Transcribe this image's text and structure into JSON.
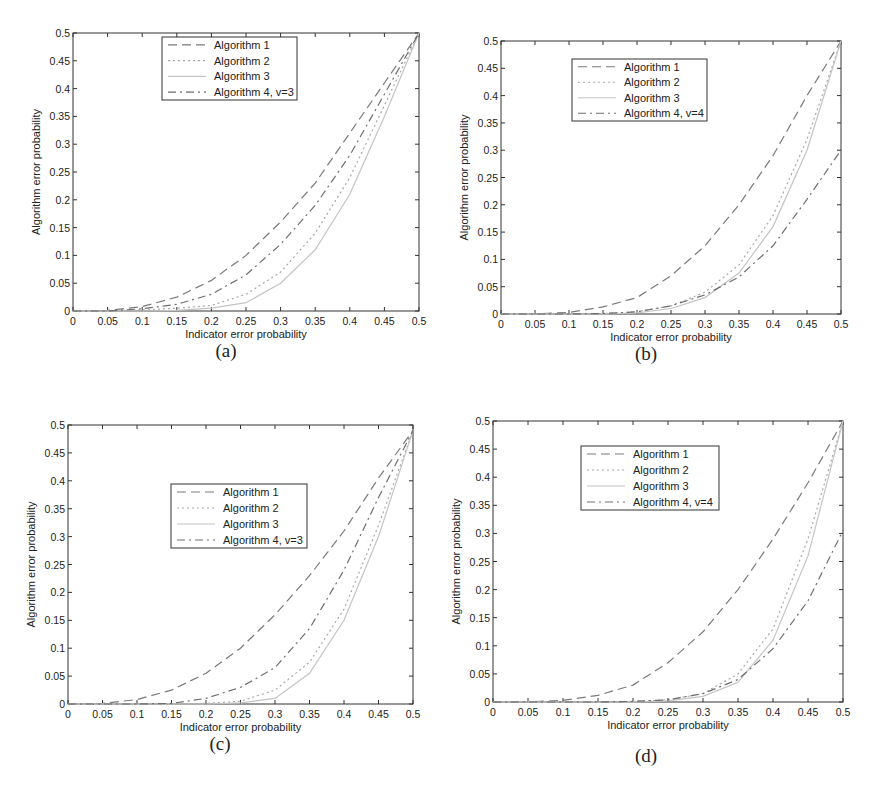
{
  "figure": {
    "panels": [
      {
        "id": "a",
        "label": "(a)"
      },
      {
        "id": "b",
        "label": "(b)"
      },
      {
        "id": "c",
        "label": "(c)"
      },
      {
        "id": "d",
        "label": "(d)"
      }
    ]
  },
  "chart_data": [
    {
      "panel": "(a)",
      "type": "line",
      "title": "",
      "xlabel": "Indicator error probability",
      "ylabel": "Algorithm error probability",
      "xlim": [
        0,
        0.5
      ],
      "ylim": [
        0,
        0.5
      ],
      "xticks": [
        "0",
        "0.05",
        "0.1",
        "0.15",
        "0.2",
        "0.25",
        "0.3",
        "0.35",
        "0.4",
        "0.45",
        "0.5"
      ],
      "yticks": [
        "0",
        "0.05",
        "0.1",
        "0.15",
        "0.2",
        "0.25",
        "0.3",
        "0.35",
        "0.4",
        "0.45",
        "0.5"
      ],
      "grid": false,
      "legend_position": "upper center",
      "x": [
        0,
        0.05,
        0.1,
        0.15,
        0.2,
        0.25,
        0.3,
        0.35,
        0.4,
        0.45,
        0.5
      ],
      "series": [
        {
          "name": "Algorithm 1",
          "style": "dashed",
          "values": [
            0,
            0.001,
            0.008,
            0.025,
            0.055,
            0.1,
            0.16,
            0.23,
            0.32,
            0.41,
            0.5
          ]
        },
        {
          "name": "Algorithm 2",
          "style": "dotted",
          "values": [
            0,
            0.0,
            0.002,
            0.005,
            0.01,
            0.03,
            0.07,
            0.14,
            0.24,
            0.37,
            0.5
          ]
        },
        {
          "name": "Algorithm 3",
          "style": "solid",
          "values": [
            0,
            0.0,
            0.0,
            0.001,
            0.005,
            0.015,
            0.05,
            0.11,
            0.21,
            0.35,
            0.5
          ]
        },
        {
          "name": "Algorithm 4, v=3",
          "style": "dashdot",
          "values": [
            0,
            0.0,
            0.004,
            0.012,
            0.03,
            0.065,
            0.12,
            0.19,
            0.28,
            0.39,
            0.5
          ]
        }
      ]
    },
    {
      "panel": "(b)",
      "type": "line",
      "title": "",
      "xlabel": "Indicator error probability",
      "ylabel": "Algorithm error probability",
      "xlim": [
        0,
        0.5
      ],
      "ylim": [
        0,
        0.5
      ],
      "xticks": [
        "0",
        "0.05",
        "0.1",
        "0.15",
        "0.2",
        "0.25",
        "0.3",
        "0.35",
        "0.4",
        "0.45",
        "0.5"
      ],
      "yticks": [
        "0",
        "0.05",
        "0.1",
        "0.15",
        "0.2",
        "0.25",
        "0.3",
        "0.35",
        "0.4",
        "0.45",
        "0.5"
      ],
      "grid": false,
      "legend_position": "upper left",
      "x": [
        0,
        0.05,
        0.1,
        0.15,
        0.2,
        0.25,
        0.3,
        0.35,
        0.4,
        0.45,
        0.5
      ],
      "series": [
        {
          "name": "Algorithm 1",
          "style": "dashed",
          "values": [
            0,
            0.0,
            0.003,
            0.013,
            0.03,
            0.07,
            0.125,
            0.2,
            0.29,
            0.4,
            0.5
          ]
        },
        {
          "name": "Algorithm 2",
          "style": "dotted",
          "values": [
            0,
            0.0,
            0.0,
            0.001,
            0.004,
            0.015,
            0.04,
            0.09,
            0.18,
            0.32,
            0.5
          ]
        },
        {
          "name": "Algorithm 3",
          "style": "solid",
          "values": [
            0,
            0.0,
            0.0,
            0.0,
            0.002,
            0.01,
            0.03,
            0.075,
            0.16,
            0.3,
            0.5
          ]
        },
        {
          "name": "Algorithm 4, v=4",
          "style": "dashdot",
          "values": [
            0,
            0.0,
            0.0,
            0.001,
            0.004,
            0.015,
            0.035,
            0.068,
            0.125,
            0.21,
            0.3
          ]
        }
      ]
    },
    {
      "panel": "(c)",
      "type": "line",
      "title": "",
      "xlabel": "Indicator error probability",
      "ylabel": "Algorithm error probability",
      "xlim": [
        0,
        0.5
      ],
      "ylim": [
        0,
        0.5
      ],
      "xticks": [
        "0",
        "0.05",
        "0.1",
        "0.15",
        "0.2",
        "0.25",
        "0.3",
        "0.35",
        "0.4",
        "0.45",
        "0.5"
      ],
      "yticks": [
        "0",
        "0.05",
        "0.1",
        "0.15",
        "0.2",
        "0.25",
        "0.3",
        "0.35",
        "0.4",
        "0.45",
        "0.5"
      ],
      "grid": false,
      "legend_position": "center",
      "x": [
        0,
        0.05,
        0.1,
        0.15,
        0.2,
        0.25,
        0.3,
        0.35,
        0.4,
        0.45,
        0.5
      ],
      "series": [
        {
          "name": "Algorithm 1",
          "style": "dashed",
          "values": [
            0,
            0.001,
            0.008,
            0.025,
            0.055,
            0.1,
            0.16,
            0.23,
            0.31,
            0.405,
            0.49
          ]
        },
        {
          "name": "Algorithm 2",
          "style": "dotted",
          "values": [
            0,
            0.0,
            0.0,
            0.0,
            0.001,
            0.005,
            0.025,
            0.075,
            0.17,
            0.32,
            0.49
          ]
        },
        {
          "name": "Algorithm 3",
          "style": "solid",
          "values": [
            0,
            0.0,
            0.0,
            0.0,
            0.0,
            0.002,
            0.01,
            0.055,
            0.15,
            0.3,
            0.49
          ]
        },
        {
          "name": "Algorithm 4, v=3",
          "style": "dashdot",
          "values": [
            0,
            0.0,
            0.0,
            0.001,
            0.01,
            0.03,
            0.065,
            0.135,
            0.24,
            0.37,
            0.49
          ]
        }
      ]
    },
    {
      "panel": "(d)",
      "type": "line",
      "title": "",
      "xlabel": "Indicator error probability",
      "ylabel": "Algorithm error probability",
      "xlim": [
        0,
        0.5
      ],
      "ylim": [
        0,
        0.5
      ],
      "xticks": [
        "0",
        "0.05",
        "0.1",
        "0.15",
        "0.2",
        "0.25",
        "0.3",
        "0.35",
        "0.4",
        "0.45",
        "0.5"
      ],
      "yticks": [
        "0",
        "0.05",
        "0.1",
        "0.15",
        "0.2",
        "0.25",
        "0.3",
        "0.35",
        "0.4",
        "0.45",
        "0.5"
      ],
      "grid": false,
      "legend_position": "upper center",
      "x": [
        0,
        0.05,
        0.1,
        0.15,
        0.2,
        0.25,
        0.3,
        0.35,
        0.4,
        0.45,
        0.5
      ],
      "series": [
        {
          "name": "Algorithm 1",
          "style": "dashed",
          "values": [
            0,
            0.0,
            0.003,
            0.012,
            0.03,
            0.07,
            0.125,
            0.2,
            0.29,
            0.39,
            0.5
          ]
        },
        {
          "name": "Algorithm 2",
          "style": "dotted",
          "values": [
            0,
            0.0,
            0.0,
            0.0,
            0.001,
            0.004,
            0.015,
            0.05,
            0.13,
            0.29,
            0.5
          ]
        },
        {
          "name": "Algorithm 3",
          "style": "solid",
          "values": [
            0,
            0.0,
            0.0,
            0.0,
            0.0,
            0.002,
            0.01,
            0.035,
            0.11,
            0.26,
            0.5
          ]
        },
        {
          "name": "Algorithm 4, v=4",
          "style": "dashdot",
          "values": [
            0,
            0.0,
            0.0,
            0.0,
            0.001,
            0.004,
            0.015,
            0.04,
            0.095,
            0.18,
            0.305
          ]
        }
      ]
    }
  ],
  "styles": {
    "axis_color": "#333333",
    "series_colors": {
      "dashed": "#7a7a7a",
      "dotted": "#a8a8a8",
      "solid": "#c4c4c4",
      "dashdot": "#6e6e6e"
    }
  }
}
